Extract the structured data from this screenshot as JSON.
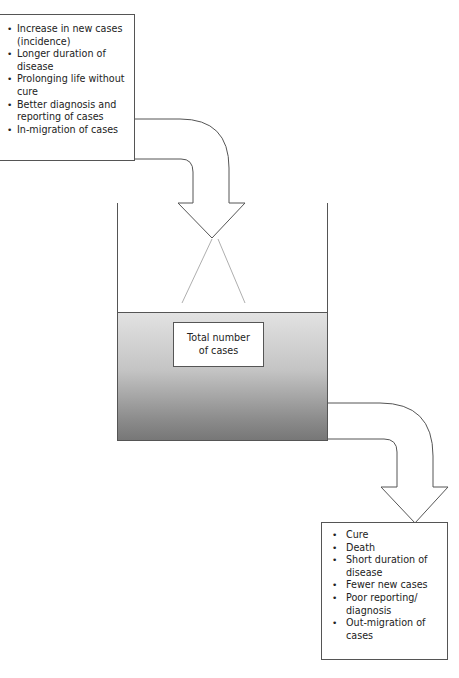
{
  "diagram": {
    "type": "stock-and-flow",
    "inflow_box": {
      "items": [
        "Increase in new cases (incidence)",
        "Longer duration of disease",
        "Prolonging life without cure",
        "Better diagnosis and reporting of cases",
        "In-migration of cases"
      ]
    },
    "container": {
      "label_line1": "Total number",
      "label_line2": "of cases"
    },
    "outflow_box": {
      "items": [
        "Cure",
        "Death",
        "Short duration of disease",
        "Fewer new cases",
        "Poor reporting/ diagnosis",
        "Out-migration of cases"
      ]
    },
    "colors": {
      "stroke": "#555555",
      "liquid_top": "#e2e2e2",
      "liquid_bottom": "#777777",
      "background": "#ffffff"
    }
  }
}
